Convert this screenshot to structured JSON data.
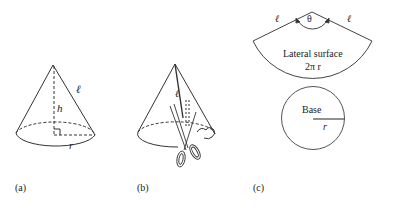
{
  "figure": {
    "panel_a": {
      "caption": "(a)",
      "labels": {
        "slant": "ℓ",
        "height": "h",
        "radius": "r"
      }
    },
    "panel_b": {
      "caption": "(b)",
      "labels": {
        "slant": "ℓ"
      }
    },
    "panel_c": {
      "caption": "(c)",
      "sector": {
        "angle_label": "θ",
        "left_side": "ℓ",
        "right_side": "ℓ",
        "title": "Lateral surface",
        "arc_length": "2π r"
      },
      "base": {
        "title": "Base",
        "radius": "r"
      }
    }
  },
  "colors": {
    "stroke": "#333333",
    "text": "#222222"
  }
}
